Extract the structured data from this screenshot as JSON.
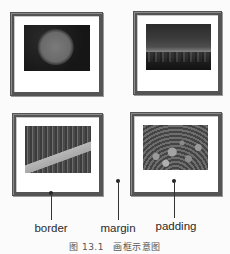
{
  "diagram": {
    "frames": [
      {
        "id": "frame-1",
        "photo": "dandelion-seedhead",
        "position": "top-left"
      },
      {
        "id": "frame-2",
        "photo": "forest-sunset",
        "position": "top-right"
      },
      {
        "id": "frame-3",
        "photo": "garden-bridge",
        "position": "bottom-left"
      },
      {
        "id": "frame-4",
        "photo": "flower-field",
        "position": "bottom-right"
      }
    ],
    "labels": {
      "border": "border",
      "margin": "margin",
      "padding": "padding"
    },
    "caption": "图 13.1　画框示意图",
    "colors": {
      "border": "#545454",
      "padding": "#ffffff",
      "background": "#fbfbfb",
      "pointer": "#333333"
    }
  }
}
